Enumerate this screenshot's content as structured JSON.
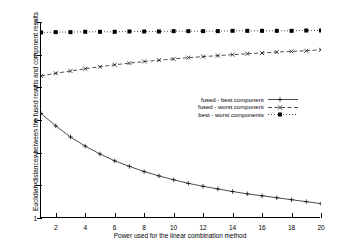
{
  "chart_data": {
    "type": "line",
    "title": "",
    "xlabel": "Power used for the linear combination method",
    "ylabel": "Euclidian distances between the fused results and component results",
    "xlim": [
      1,
      20
    ],
    "ylim": [
      1,
      7
    ],
    "xticks": [
      2,
      4,
      6,
      8,
      10,
      12,
      14,
      16,
      18,
      20
    ],
    "yticks": [
      1,
      2,
      3,
      4,
      5,
      6,
      7
    ],
    "grid": false,
    "legend_position": "center-right",
    "x": [
      1,
      2,
      3,
      4,
      5,
      6,
      7,
      8,
      9,
      10,
      11,
      12,
      13,
      14,
      15,
      16,
      17,
      18,
      19,
      20
    ],
    "series": [
      {
        "name": "fused - best component",
        "marker": "plus",
        "linestyle": "solid",
        "color": "#000000",
        "values": [
          4.2,
          3.82,
          3.48,
          3.2,
          2.96,
          2.75,
          2.58,
          2.42,
          2.29,
          2.17,
          2.06,
          1.97,
          1.89,
          1.81,
          1.74,
          1.68,
          1.62,
          1.56,
          1.5,
          1.44
        ]
      },
      {
        "name": "fused - worst component",
        "marker": "x",
        "linestyle": "dashed",
        "color": "#000000",
        "values": [
          5.35,
          5.43,
          5.5,
          5.57,
          5.63,
          5.69,
          5.74,
          5.79,
          5.83,
          5.87,
          5.91,
          5.94,
          5.97,
          6.0,
          6.03,
          6.05,
          6.08,
          6.1,
          6.12,
          6.15
        ]
      },
      {
        "name": "best - worst components",
        "marker": "square",
        "linestyle": "dotted",
        "color": "#000000",
        "values": [
          6.68,
          6.69,
          6.69,
          6.7,
          6.7,
          6.7,
          6.71,
          6.71,
          6.71,
          6.72,
          6.72,
          6.72,
          6.72,
          6.73,
          6.73,
          6.73,
          6.73,
          6.73,
          6.74,
          6.74
        ]
      }
    ]
  },
  "legend": {
    "items": [
      {
        "label": "fused - best component"
      },
      {
        "label": "fused - worst component"
      },
      {
        "label": "best - worst components"
      }
    ]
  }
}
